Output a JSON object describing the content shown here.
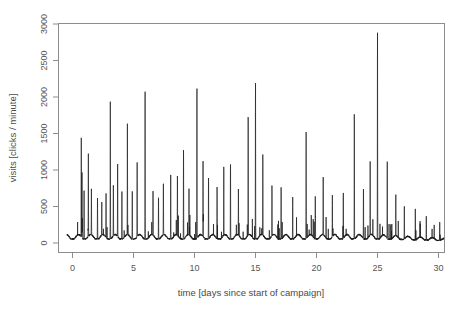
{
  "chart_data": {
    "type": "line",
    "title": "",
    "xlabel": "time [days since start of campaign]",
    "ylabel": "visits [clicks / minute]",
    "xlim": [
      -0.6,
      30.8
    ],
    "ylim": [
      -40,
      3050
    ],
    "xticks": [
      0,
      5,
      10,
      15,
      20,
      25,
      30
    ],
    "xticklabels": [
      "0",
      "5",
      "10",
      "15",
      "20",
      "25",
      "30"
    ],
    "yticks": [
      0,
      500,
      1000,
      1500,
      2000,
      2500,
      3000
    ],
    "yticklabels": [
      "0",
      "500",
      "1000",
      "1500",
      "2000",
      "2500",
      "3000"
    ],
    "grid": false,
    "legend": null,
    "series_name": "visits",
    "line_color": "#1a1a1a",
    "frame_color": "#8d8d8d",
    "background": "#ffffff",
    "baseline_range": [
      20,
      150
    ],
    "max_value": 2850,
    "max_value_day": 25.0,
    "notable_spikes": [
      {
        "day": 0.72,
        "value": 1440
      },
      {
        "day": 0.78,
        "value": 900
      },
      {
        "day": 0.95,
        "value": 700
      },
      {
        "day": 1.3,
        "value": 1130
      },
      {
        "day": 1.55,
        "value": 620
      },
      {
        "day": 2.05,
        "value": 560
      },
      {
        "day": 2.4,
        "value": 480
      },
      {
        "day": 2.75,
        "value": 620
      },
      {
        "day": 3.1,
        "value": 1900
      },
      {
        "day": 3.35,
        "value": 700
      },
      {
        "day": 3.7,
        "value": 1050
      },
      {
        "day": 4.05,
        "value": 640
      },
      {
        "day": 4.5,
        "value": 1540
      },
      {
        "day": 4.9,
        "value": 690
      },
      {
        "day": 5.3,
        "value": 1020
      },
      {
        "day": 5.95,
        "value": 2100
      },
      {
        "day": 6.6,
        "value": 600
      },
      {
        "day": 7.05,
        "value": 560
      },
      {
        "day": 7.45,
        "value": 720
      },
      {
        "day": 8.05,
        "value": 880
      },
      {
        "day": 8.6,
        "value": 810
      },
      {
        "day": 9.1,
        "value": 1240
      },
      {
        "day": 9.55,
        "value": 640
      },
      {
        "day": 10.2,
        "value": 2140
      },
      {
        "day": 10.7,
        "value": 1090
      },
      {
        "day": 11.15,
        "value": 860
      },
      {
        "day": 11.85,
        "value": 720
      },
      {
        "day": 12.4,
        "value": 980
      },
      {
        "day": 12.95,
        "value": 1060
      },
      {
        "day": 13.6,
        "value": 640
      },
      {
        "day": 14.4,
        "value": 1700
      },
      {
        "day": 15.0,
        "value": 2150
      },
      {
        "day": 15.6,
        "value": 1120
      },
      {
        "day": 16.35,
        "value": 700
      },
      {
        "day": 17.1,
        "value": 720
      },
      {
        "day": 18.05,
        "value": 580
      },
      {
        "day": 19.15,
        "value": 1540
      },
      {
        "day": 19.9,
        "value": 620
      },
      {
        "day": 20.55,
        "value": 790
      },
      {
        "day": 21.3,
        "value": 560
      },
      {
        "day": 22.2,
        "value": 640
      },
      {
        "day": 23.1,
        "value": 1730
      },
      {
        "day": 23.85,
        "value": 690
      },
      {
        "day": 24.4,
        "value": 1060
      },
      {
        "day": 25.0,
        "value": 2850
      },
      {
        "day": 25.8,
        "value": 1050
      },
      {
        "day": 26.5,
        "value": 560
      },
      {
        "day": 27.2,
        "value": 470
      },
      {
        "day": 28.1,
        "value": 420
      },
      {
        "day": 29.0,
        "value": 330
      },
      {
        "day": 30.1,
        "value": 260
      }
    ]
  },
  "figure": {
    "axis_labels": {
      "x": "time [days since start of campaign]",
      "y": "visits [clicks / minute]"
    }
  }
}
